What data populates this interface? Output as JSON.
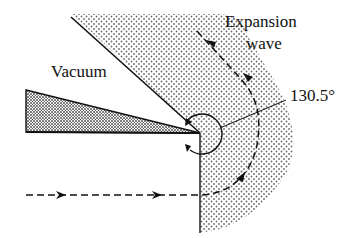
{
  "labels": {
    "vacuum": "Vacuum",
    "expansion_line1": "Expansion",
    "expansion_line2": "wave",
    "angle": "130.5°"
  },
  "colors": {
    "line": "#111111",
    "stipple": "#6a6a6a",
    "dense_stipple": "#555555",
    "background": "#ffffff"
  },
  "diagram": {
    "turning_angle_deg": 130.5,
    "elements": [
      "wall-wedge",
      "vertical-wall",
      "vacuum-boundary",
      "expansion-fan-region",
      "streamline",
      "angle-arc",
      "angle-leader"
    ]
  }
}
